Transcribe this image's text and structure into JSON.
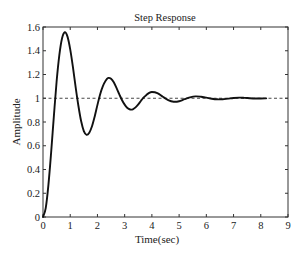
{
  "chart_data": {
    "type": "line",
    "title": "Step Response",
    "xlabel": "Time(sec)",
    "ylabel": "Amplitude",
    "xlim": [
      0,
      9
    ],
    "ylim": [
      0,
      1.6
    ],
    "xticks": [
      0,
      1,
      2,
      3,
      4,
      5,
      6,
      7,
      8,
      9
    ],
    "xtick_labels": [
      "0",
      "1",
      "2",
      "3",
      "4",
      "5",
      "6",
      "7",
      "8",
      "9"
    ],
    "yticks": [
      0,
      0.2,
      0.4,
      0.6,
      0.8,
      1,
      1.2,
      1.4,
      1.6
    ],
    "ytick_labels": [
      "0",
      "0.2",
      "0.4",
      "0.6",
      "0.8",
      "1",
      "1.2",
      "1.4",
      "1.6"
    ],
    "grid": false,
    "legend": null,
    "series": [
      {
        "name": "step response",
        "style": "solid",
        "color": "#111111",
        "x": [
          0,
          0.1,
          0.2,
          0.3,
          0.4,
          0.5,
          0.6,
          0.7,
          0.8,
          0.9,
          1.0,
          1.1,
          1.2,
          1.3,
          1.4,
          1.5,
          1.6,
          1.7,
          1.8,
          1.9,
          2.0,
          2.1,
          2.2,
          2.3,
          2.4,
          2.5,
          2.6,
          2.7,
          2.8,
          2.9,
          3.0,
          3.1,
          3.2,
          3.3,
          3.4,
          3.5,
          3.6,
          3.7,
          3.8,
          3.9,
          4.0,
          4.2,
          4.4,
          4.6,
          4.8,
          5.0,
          5.2,
          5.4,
          5.6,
          5.8,
          6.0,
          6.2,
          6.4,
          6.6,
          6.8,
          7.0,
          7.2,
          7.4,
          7.6,
          7.8,
          8.0,
          8.2
        ],
        "y": [
          0,
          0.075,
          0.273,
          0.547,
          0.852,
          1.141,
          1.363,
          1.505,
          1.556,
          1.519,
          1.412,
          1.262,
          1.091,
          0.937,
          0.808,
          0.724,
          0.692,
          0.71,
          0.764,
          0.847,
          0.944,
          1.034,
          1.102,
          1.148,
          1.171,
          1.164,
          1.134,
          1.087,
          1.035,
          0.985,
          0.946,
          0.918,
          0.905,
          0.907,
          0.923,
          0.948,
          0.979,
          1.007,
          1.028,
          1.045,
          1.053,
          1.044,
          1.013,
          0.985,
          0.971,
          0.975,
          0.992,
          1.007,
          1.016,
          1.013,
          1.005,
          0.996,
          0.991,
          0.992,
          0.997,
          1.002,
          1.005,
          1.003,
          1.0,
          0.998,
          0.998,
          0.999
        ]
      },
      {
        "name": "steady-state reference",
        "style": "dashed",
        "color": "#333333",
        "x": [
          0,
          9
        ],
        "y": [
          1,
          1
        ]
      }
    ],
    "annotations": []
  },
  "layout": {
    "plot_left": 43,
    "plot_top": 27,
    "plot_right": 288,
    "plot_bottom": 217
  }
}
